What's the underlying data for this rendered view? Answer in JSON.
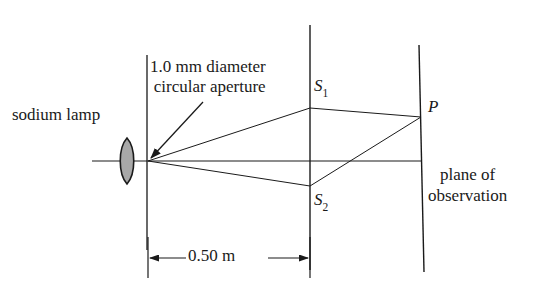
{
  "figure": {
    "background_color": "#ffffff",
    "line_color": "#1a1a1a",
    "lens_fill_color": "#a8a8a8",
    "width": 554,
    "height": 295
  },
  "labels": {
    "source": "sodium lamp",
    "aperture_line1": "1.0 mm diameter",
    "aperture_line2": "circular aperture",
    "slit_upper": "S",
    "slit_upper_sub": "1",
    "slit_lower": "S",
    "slit_lower_sub": "2",
    "point": "P",
    "screen_line1": "plane of",
    "screen_line2": "observation",
    "distance": "0.50 m"
  },
  "geometry": {
    "optical_axis_y": 161,
    "axis_start_x": 92,
    "lens_center_x": 127,
    "lens_top_y": 138,
    "lens_bottom_y": 184,
    "aperture_x": 147,
    "aperture_y": 161,
    "aperture_barrier_top_y": 55,
    "aperture_barrier_bottom_y": 250,
    "slit_barrier_x": 310,
    "slit_barrier_top_y": 25,
    "slit_barrier_bottom_y": 270,
    "slit1_y": 108,
    "slit2_y": 186,
    "screen_x_top": 419,
    "screen_x_bottom": 424,
    "screen_top_y": 45,
    "screen_bottom_y": 272,
    "point_p_x": 421,
    "point_p_y": 117,
    "dimension_y": 258,
    "dimension_left_x": 148,
    "dimension_right_x": 310,
    "callout_arrow_start_x": 203,
    "callout_arrow_start_y": 102,
    "callout_arrow_end_x": 150,
    "callout_arrow_end_y": 158
  }
}
